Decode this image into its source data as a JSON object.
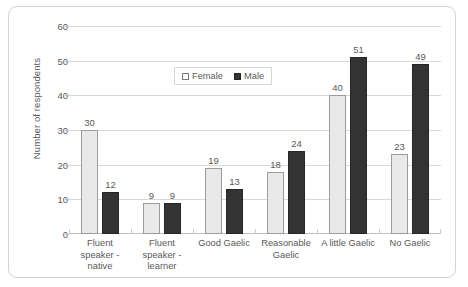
{
  "chart_data": {
    "type": "bar",
    "title": "",
    "xlabel": "",
    "ylabel": "Number of respondents",
    "ylim": [
      0,
      60
    ],
    "ytick_step": 10,
    "yticks": [
      0,
      10,
      20,
      30,
      40,
      50,
      60
    ],
    "grid": true,
    "legend_position": "upper center",
    "categories": [
      "Fluent speaker - native",
      "Fluent speaker - learner",
      "Good Gaelic",
      "Reasonable Gaelic",
      "A little Gaelic",
      "No Gaelic"
    ],
    "category_lines": [
      [
        "Fluent speaker -",
        "native"
      ],
      [
        "Fluent speaker -",
        "learner"
      ],
      [
        "Good Gaelic",
        ""
      ],
      [
        "Reasonable",
        "Gaelic"
      ],
      [
        "A little Gaelic",
        ""
      ],
      [
        "No Gaelic",
        ""
      ]
    ],
    "series": [
      {
        "name": "Female",
        "color": "#e9e9e9",
        "border_color": "#9c9c9c",
        "values": [
          30,
          9,
          19,
          18,
          40,
          23
        ]
      },
      {
        "name": "Male",
        "color": "#333333",
        "border_color": "#262626",
        "values": [
          12,
          9,
          13,
          24,
          51,
          49
        ]
      }
    ]
  },
  "legend": {
    "items": [
      {
        "label": "Female",
        "swatch": "open-square-swatch"
      },
      {
        "label": "Male",
        "swatch": "filled-square-swatch"
      }
    ]
  },
  "axis": {
    "y_title": "Number of respondents",
    "y_ticks": [
      "60",
      "50",
      "40",
      "30",
      "20",
      "10",
      "0"
    ]
  }
}
